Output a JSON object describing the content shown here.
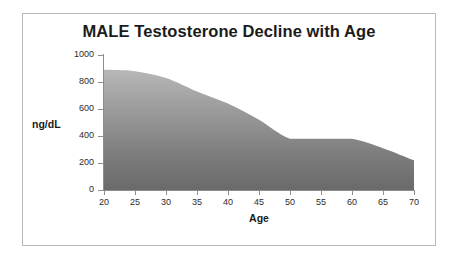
{
  "chart_data": {
    "type": "area",
    "title": "MALE Testosterone Decline with Age",
    "xlabel": "Age",
    "ylabel": "ng/dL",
    "xlim": [
      20,
      70
    ],
    "ylim": [
      0,
      1000
    ],
    "grid": false,
    "legend": null,
    "xticks": [
      20,
      25,
      30,
      35,
      40,
      45,
      50,
      55,
      60,
      65,
      70
    ],
    "yticks": [
      0,
      200,
      400,
      600,
      800,
      1000
    ],
    "series": [
      {
        "name": "Testosterone",
        "fill": "vertical-gradient-gray",
        "x": [
          20,
          25,
          30,
          35,
          40,
          45,
          50,
          55,
          60,
          65,
          70
        ],
        "values": [
          890,
          880,
          830,
          730,
          640,
          520,
          380,
          380,
          380,
          310,
          220
        ]
      }
    ],
    "colors": {
      "fill_top": "#b4b4b4",
      "fill_bottom": "#6b6b6b",
      "axis": "#8d8d8d",
      "text": "#1b1b1b",
      "frame": "#b9b9b9",
      "background": "#ffffff"
    }
  }
}
